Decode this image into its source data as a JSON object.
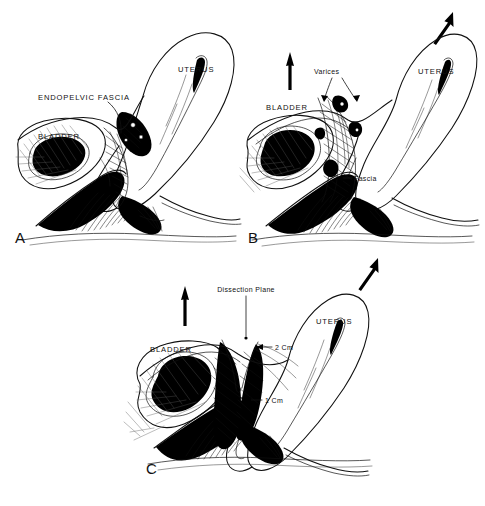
{
  "figure": {
    "background_color": "#ffffff",
    "ink_color": "#101010",
    "width": 485,
    "height": 506
  },
  "panels": [
    {
      "id": "A",
      "letter": "A",
      "labels": [
        {
          "name": "endopelvic-fascia",
          "text": "ENDOPELVIC FASCIA",
          "style": "caps"
        },
        {
          "name": "bladder",
          "text": "BLADDER",
          "style": "caps"
        },
        {
          "name": "uterus",
          "text": "UTERUS",
          "style": "caps"
        }
      ],
      "arrows": []
    },
    {
      "id": "B",
      "letter": "B",
      "labels": [
        {
          "name": "varices",
          "text": "Varices",
          "style": "mixed"
        },
        {
          "name": "fascia",
          "text": "Fascia",
          "style": "mixed"
        },
        {
          "name": "bladder",
          "text": "BLADDER",
          "style": "caps"
        },
        {
          "name": "uterus",
          "text": "UTERUS",
          "style": "caps"
        }
      ],
      "arrows": [
        {
          "name": "traction-arrow-up",
          "direction": "up"
        },
        {
          "name": "traction-arrow-up-right",
          "direction": "up-right"
        }
      ]
    },
    {
      "id": "C",
      "letter": "C",
      "labels": [
        {
          "name": "dissection-plane",
          "text": "Dissection Plane",
          "style": "mixed"
        },
        {
          "name": "measure-2cm",
          "text": "2 Cm",
          "style": "mixed"
        },
        {
          "name": "measure-1cm",
          "text": "1 Cm",
          "style": "mixed"
        },
        {
          "name": "bladder",
          "text": "BLADDER",
          "style": "caps"
        },
        {
          "name": "uterus",
          "text": "UTERUS",
          "style": "caps"
        }
      ],
      "arrows": [
        {
          "name": "traction-arrow-up",
          "direction": "up"
        },
        {
          "name": "traction-arrow-up-right",
          "direction": "up-right"
        }
      ]
    }
  ],
  "text": {
    "panel_a_letter": "A",
    "panel_b_letter": "B",
    "panel_c_letter": "C",
    "endopelvic_fascia": "ENDOPELVIC FASCIA",
    "bladder_a": "BLADDER",
    "uterus_a": "UTERUS",
    "varices": "Varices",
    "fascia": "Fascia",
    "bladder_b": "BLADDER",
    "uterus_b": "UTERUS",
    "dissection_plane": "Dissection Plane",
    "two_cm": "2 Cm",
    "one_cm": "1 Cm",
    "bladder_c": "BLADDER",
    "uterus_c": "UTERUS"
  }
}
